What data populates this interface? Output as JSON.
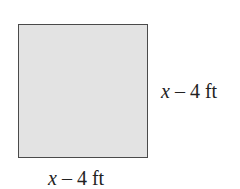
{
  "figure": {
    "shape": "square",
    "fill_color": "#e3e3e3",
    "border_color": "#4a4a4a",
    "right_side_label": {
      "variable": "x",
      "rest": " – 4 ft"
    },
    "bottom_side_label": {
      "variable": "x",
      "rest": " – 4 ft"
    }
  }
}
